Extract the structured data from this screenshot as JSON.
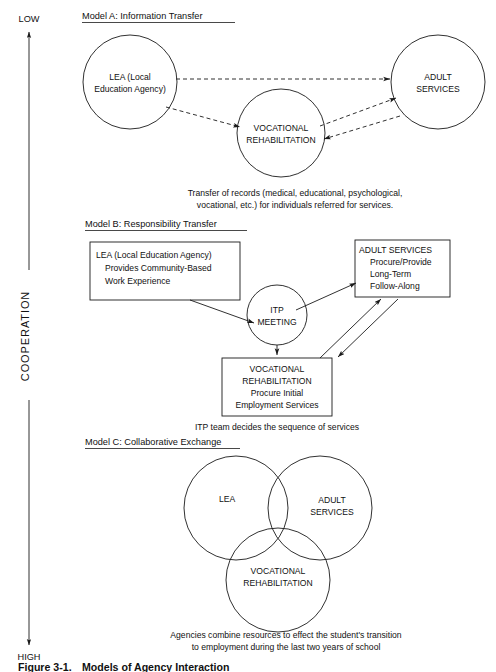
{
  "figure": {
    "caption_number": "Figure 3-1.",
    "caption_title": "Models of Agency Interaction"
  },
  "axis": {
    "label": "COOPERATION",
    "top_end": "LOW",
    "bottom_end": "HIGH"
  },
  "model_a": {
    "title": "Model A: Information Transfer",
    "nodes": {
      "lea_line1": "LEA (Local",
      "lea_line2": "Education Agency)",
      "vr_line1": "VOCATIONAL",
      "vr_line2": "REHABILITATION",
      "adult_line1": "ADULT",
      "adult_line2": "SERVICES"
    },
    "caption_line1": "Transfer of records (medical, educational, psychological,",
    "caption_line2": "vocational, etc.) for individuals referred for services."
  },
  "model_b": {
    "title": "Model B: Responsibility Transfer",
    "lea_box": {
      "line1": "LEA (Local Education Agency)",
      "line2": "Provides Community-Based",
      "line3": "Work Experience"
    },
    "itp_circle": {
      "line1": "ITP",
      "line2": "MEETING"
    },
    "adult_box": {
      "line1": "ADULT SERVICES",
      "line2": "Procure/Provide",
      "line3": "Long-Term",
      "line4": "Follow-Along"
    },
    "vr_box": {
      "line1": "VOCATIONAL",
      "line2": "REHABILITATION",
      "line3": "Procure Initial",
      "line4": "Employment Services"
    },
    "caption_line1": "ITP team decides the sequence of services"
  },
  "model_c": {
    "title": "Model C: Collaborative Exchange",
    "nodes": {
      "lea": "LEA",
      "adult_line1": "ADULT",
      "adult_line2": "SERVICES",
      "vr_line1": "VOCATIONAL",
      "vr_line2": "REHABILITATION"
    },
    "caption_line1": "Agencies combine resources to effect the student's transition",
    "caption_line2": "to employment during the last two years of school"
  },
  "colors": {
    "ink": "#1a1a1a",
    "background": "#ffffff"
  }
}
